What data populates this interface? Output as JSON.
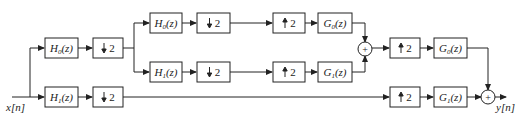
{
  "input_label": "x[n]",
  "output_label": "y[n]",
  "blocks": {
    "a_h0": {
      "name": "H",
      "sub": "0",
      "arg": "(z)"
    },
    "a_h1": {
      "name": "H",
      "sub": "1",
      "arg": "(z)"
    },
    "a_d0": {
      "text": "2",
      "dir": "down"
    },
    "a_d1": {
      "text": "2",
      "dir": "down"
    },
    "b_h0": {
      "name": "H",
      "sub": "0",
      "arg": "(z)"
    },
    "b_h1": {
      "name": "H",
      "sub": "1",
      "arg": "(z)"
    },
    "b_d0": {
      "text": "2",
      "dir": "down"
    },
    "b_d1": {
      "text": "2",
      "dir": "down"
    },
    "b_u0": {
      "text": "2",
      "dir": "up"
    },
    "b_u1": {
      "text": "2",
      "dir": "up"
    },
    "b_g0": {
      "name": "G",
      "sub": "0",
      "arg": "(z)"
    },
    "b_g1": {
      "name": "G",
      "sub": "1",
      "arg": "(z)"
    },
    "a_u0": {
      "text": "2",
      "dir": "up"
    },
    "a_u1": {
      "text": "2",
      "dir": "up"
    },
    "a_g0": {
      "name": "G",
      "sub": "0",
      "arg": "(z)"
    },
    "a_g1": {
      "name": "G",
      "sub": "1",
      "arg": "(z)"
    }
  },
  "adders": {
    "symbol": "+"
  }
}
